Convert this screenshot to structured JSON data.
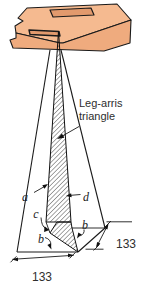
{
  "diagram": {
    "callout": {
      "line1": "Leg-arris",
      "line2": "triangle"
    },
    "part_labels": {
      "a": "a",
      "d": "d",
      "c": "c",
      "b_left": "b",
      "b_right": "b"
    },
    "dimensions": {
      "bottom": "133",
      "right": "133"
    },
    "colors": {
      "wood_top": "#f5ba90",
      "wood_front": "#efab7e",
      "wood_slot": "#e29a6d",
      "line": "#1a1a1a",
      "text": "#2e2e2e",
      "background": "#ffffff"
    }
  }
}
